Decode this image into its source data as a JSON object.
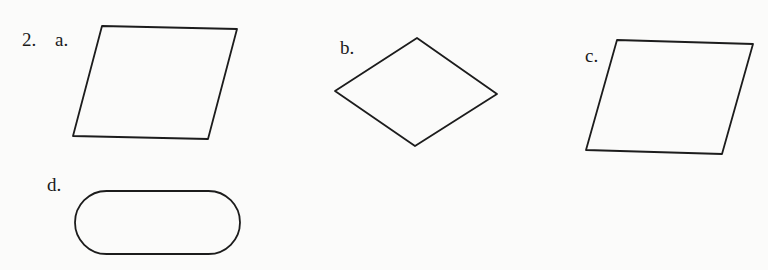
{
  "problem": {
    "number": "2.",
    "items": [
      {
        "id": "a",
        "label": "a.",
        "shape": "parallelogram"
      },
      {
        "id": "b",
        "label": "b.",
        "shape": "rhombus"
      },
      {
        "id": "c",
        "label": "c.",
        "shape": "parallelogram"
      },
      {
        "id": "d",
        "label": "d.",
        "shape": "stadium"
      }
    ]
  }
}
